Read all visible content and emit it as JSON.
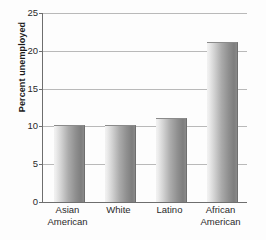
{
  "chart_data": {
    "type": "bar",
    "title": "",
    "xlabel": "",
    "ylabel": "Percent unemployed",
    "categories": [
      "Asian American",
      "White",
      "Latino",
      "African American"
    ],
    "category_lines": [
      [
        "Asian",
        "American"
      ],
      [
        "White",
        ""
      ],
      [
        "Latino",
        ""
      ],
      [
        "African",
        "American"
      ]
    ],
    "values": [
      10,
      10,
      11,
      21
    ],
    "ylim": [
      0,
      25
    ],
    "yticks": [
      0,
      5,
      10,
      15,
      20,
      25
    ],
    "ytick_labels": [
      "0",
      "5",
      "10",
      "15",
      "20",
      "25"
    ],
    "grid": true,
    "legend": false,
    "bar_color": "#9a9a9a",
    "gridline_color": "#b9b9b9",
    "axis_color": "#6e6e6e"
  },
  "axis": {
    "y_title": "Percent unemployed"
  }
}
